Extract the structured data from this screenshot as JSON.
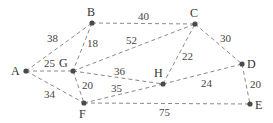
{
  "graph": {
    "nodes": [
      {
        "id": "A",
        "x": 26,
        "y": 71,
        "lx": 11,
        "ly": 75
      },
      {
        "id": "B",
        "x": 92,
        "y": 23,
        "lx": 87,
        "ly": 16
      },
      {
        "id": "C",
        "x": 195,
        "y": 24,
        "lx": 190,
        "ly": 17
      },
      {
        "id": "D",
        "x": 242,
        "y": 64,
        "lx": 247,
        "ly": 68
      },
      {
        "id": "E",
        "x": 250,
        "y": 104,
        "lx": 255,
        "ly": 109
      },
      {
        "id": "F",
        "x": 84,
        "y": 103,
        "lx": 79,
        "ly": 118
      },
      {
        "id": "G",
        "x": 73,
        "y": 71,
        "lx": 59,
        "ly": 67
      },
      {
        "id": "H",
        "x": 163,
        "y": 84,
        "lx": 154,
        "ly": 77
      }
    ],
    "edges": [
      {
        "from": "A",
        "to": "B",
        "weight": "38",
        "wx": 47,
        "wy": 42
      },
      {
        "from": "A",
        "to": "G",
        "weight": "25",
        "wx": 44,
        "wy": 67
      },
      {
        "from": "A",
        "to": "F",
        "weight": "34",
        "wx": 44,
        "wy": 98
      },
      {
        "from": "B",
        "to": "G",
        "weight": "18",
        "wx": 87,
        "wy": 47
      },
      {
        "from": "B",
        "to": "C",
        "weight": "40",
        "wx": 138,
        "wy": 20
      },
      {
        "from": "G",
        "to": "C",
        "weight": "52",
        "wx": 126,
        "wy": 44
      },
      {
        "from": "G",
        "to": "H",
        "weight": "36",
        "wx": 114,
        "wy": 75
      },
      {
        "from": "G",
        "to": "F",
        "weight": "20",
        "wx": 82,
        "wy": 89
      },
      {
        "from": "F",
        "to": "H",
        "weight": "35",
        "wx": 111,
        "wy": 92
      },
      {
        "from": "H",
        "to": "C",
        "weight": "22",
        "wx": 182,
        "wy": 60
      },
      {
        "from": "H",
        "to": "D",
        "weight": "24",
        "wx": 201,
        "wy": 87
      },
      {
        "from": "C",
        "to": "D",
        "weight": "30",
        "wx": 220,
        "wy": 42
      },
      {
        "from": "D",
        "to": "E",
        "weight": "20",
        "wx": 250,
        "wy": 88
      },
      {
        "from": "F",
        "to": "E",
        "weight": "75",
        "wx": 159,
        "wy": 116
      }
    ]
  }
}
